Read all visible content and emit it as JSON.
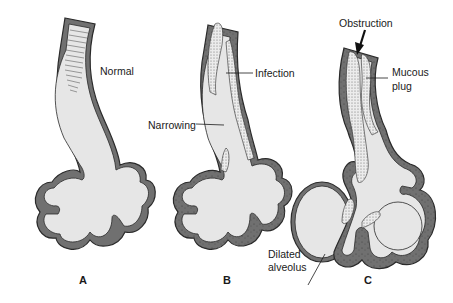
{
  "diagram": {
    "colors": {
      "wall": "#707070",
      "wall_outline": "#2a2a2a",
      "lumen": "#e6e6e6",
      "mucus": "#d9d9d9",
      "background": "#ffffff"
    },
    "panels": [
      {
        "letter": "A",
        "labels": [
          {
            "text": "Normal"
          }
        ]
      },
      {
        "letter": "B",
        "labels": [
          {
            "text": "Infection"
          },
          {
            "text": "Narrowing"
          }
        ]
      },
      {
        "letter": "C",
        "labels": [
          {
            "text": "Obstruction"
          },
          {
            "text": "Mucous"
          },
          {
            "text": "plug"
          },
          {
            "text": "Dilated"
          },
          {
            "text": "alveolus"
          }
        ]
      }
    ]
  }
}
